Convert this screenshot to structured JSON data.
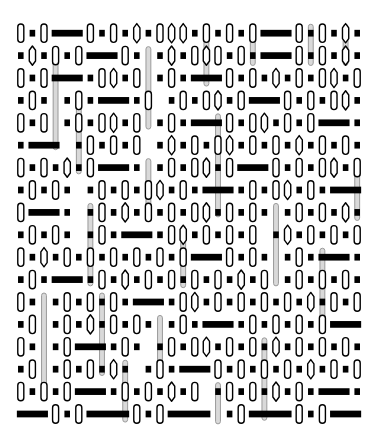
{
  "artwork": {
    "title": "Abstract Grid Pattern",
    "description": "Dense monochrome generative grid of vertical capsule outlines, solid black bars and squares, and tall light-gray vertical columns",
    "width": 376,
    "height": 447
  },
  "canvas": {
    "background_color": "#ffffff",
    "origin_x": 15,
    "origin_y": 22,
    "cell_width": 11.6,
    "cell_height": 22.4,
    "columns": 30,
    "rows": 18
  },
  "palette": {
    "background": "#ffffff",
    "ink": "#000000",
    "outline": "#1a1a1a",
    "gray_bar": "#d9d9d9",
    "gray_bar_outline": "#9a9a9a",
    "fill_white": "#ffffff"
  },
  "glyphs": {
    "capsule": {
      "name": "vertical-capsule-outline",
      "fill": "#ffffff",
      "stroke": "#000000",
      "stroke_width": 1.4,
      "width_ratio": 0.52,
      "height_ratio": 0.82,
      "corner_radius_ratio": 0.5
    },
    "hexcapsule": {
      "name": "vertical-hex-capsule-outline",
      "fill": "#ffffff",
      "stroke": "#000000",
      "stroke_width": 1.4,
      "width_ratio": 0.54,
      "height_ratio": 0.86
    },
    "square": {
      "name": "solid-black-square",
      "fill": "#000000",
      "width_ratio": 0.48,
      "height_ratio": 0.3
    },
    "bar": {
      "name": "solid-black-horizontal-bar",
      "fill": "#000000",
      "height_ratio": 0.3
    },
    "graycolumn": {
      "name": "tall-gray-vertical-column",
      "fill": "#d9d9d9",
      "stroke": "#9a9a9a",
      "stroke_width": 1.0,
      "width_ratio": 0.42
    }
  },
  "chart_data": {
    "type": "heatmap",
    "title": "Abstract Grid Pattern",
    "xlabel": "",
    "ylabel": "",
    "legend": [],
    "grid": false,
    "columns": 30,
    "rows": 18,
    "symbol_key": {
      "C": "capsule",
      "H": "hex-capsule",
      "S": "black-square",
      "B": "black-bar-segment",
      "G": "gray-column-segment",
      "_": "empty"
    },
    "cells": [
      "CSCBBBCSCSHSCHHSCSCSCBBBCSCSHS",
      "SHSCSCBBBCSGSHSCHCSCSBBBCSCSHS",
      "CSCBBBSCHSCGSCSBBBCSCSHSCSCHSC",
      "SCSGSCSBBBSCGSCSCHSCBBBCSCSCHS",
      "CSCGSCSCHSCGSCSBBBCSCHSCSCBBBS",
      "SBBBGSCSCSCGSHSCSCHSCSCSHSCSCS",
      "CSCSHSCBBBSGSCSCHSCBBBCSCSCHSC",
      "SCSCSGSCSCSCHSCSBBBSCSCHSCSBBB",
      "CBBBSGSCSHSCSCSCHSCSCSGSCSCSHS",
      "SCSCSGSCSBBBSCHSCSCSCGSHSCSCSC",
      "CSHSCSCSCSCSCSCBBBCSCSGSCSBBBS",
      "SCSBBBSCSHSCSCSCSCSHSCGSCSCSCS",
      "CSGSCSCSCSBBBSCHSCSCSCSCSHSCSC",
      "SCGSCSHSCSCSGSCSBBBSCSCSCSCBBB",
      "CSGSCBBBSCSGSCSCHSCSCSHSCSCSCS",
      "SCGSCSCSHSGSCSBBBCSCSCSCSHSCSC",
      "CSCSCBBBSCSCSHSCGSCSCSHSCSBBBS",
      "BBBCSCBBBBCSCBBBBGSCBBBBCSCBBB"
    ],
    "gray_columns": [
      {
        "col": 3,
        "row_start": 1,
        "row_span": 5
      },
      {
        "col": 11,
        "row_start": 1,
        "row_span": 4
      },
      {
        "col": 16,
        "row_start": 0,
        "row_span": 3
      },
      {
        "col": 20,
        "row_start": 0,
        "row_span": 2
      },
      {
        "col": 25,
        "row_start": 0,
        "row_span": 2
      },
      {
        "col": 28,
        "row_start": 0,
        "row_span": 2
      },
      {
        "col": 5,
        "row_start": 3,
        "row_span": 4
      },
      {
        "col": 11,
        "row_start": 6,
        "row_span": 3
      },
      {
        "col": 17,
        "row_start": 4,
        "row_span": 5
      },
      {
        "col": 22,
        "row_start": 8,
        "row_span": 4
      },
      {
        "col": 6,
        "row_start": 8,
        "row_span": 4
      },
      {
        "col": 2,
        "row_start": 12,
        "row_span": 5
      },
      {
        "col": 7,
        "row_start": 12,
        "row_span": 4
      },
      {
        "col": 12,
        "row_start": 13,
        "row_span": 3
      },
      {
        "col": 17,
        "row_start": 16,
        "row_span": 2
      },
      {
        "col": 26,
        "row_start": 10,
        "row_span": 4
      },
      {
        "col": 9,
        "row_start": 15,
        "row_span": 3
      },
      {
        "col": 21,
        "row_start": 14,
        "row_span": 4
      },
      {
        "col": 29,
        "row_start": 6,
        "row_span": 3
      },
      {
        "col": 14,
        "row_start": 9,
        "row_span": 3
      }
    ]
  }
}
